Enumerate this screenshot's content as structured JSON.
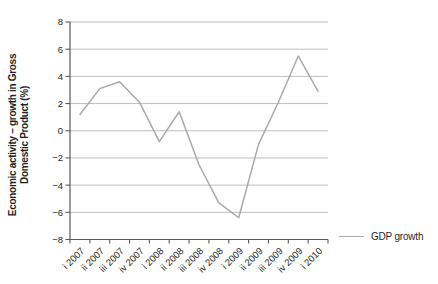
{
  "chart_data": {
    "type": "line",
    "title": "",
    "categories": [
      "i 2007",
      "ii 2007",
      "iii 2007",
      "iv 2007",
      "i 2008",
      "ii 2008",
      "iii 2008",
      "iv 2008",
      "i 2009",
      "ii 2009",
      "iii 2009",
      "iv 2009",
      "i 2010"
    ],
    "series": [
      {
        "name": "GDP growth",
        "values": [
          1.2,
          3.1,
          3.6,
          2.1,
          -0.8,
          1.4,
          -2.5,
          -5.3,
          -6.4,
          -1.0,
          2.1,
          5.5,
          2.9
        ]
      }
    ],
    "ylabel_line1": "Economic activity – growth in Gross",
    "ylabel_line2": "Domestic Product (%)",
    "xlabel": "",
    "ylim": [
      -8,
      8
    ],
    "yticks": [
      8,
      6,
      4,
      2,
      0,
      -2,
      -4,
      -6,
      -8
    ],
    "ytick_step": 2,
    "grid": true,
    "legend_position": "right-bottom",
    "colors": {
      "line": "#a9a9a9",
      "grid": "#bdbdbd",
      "axis": "#595959",
      "text": "#262626",
      "background": "#ffffff"
    }
  }
}
